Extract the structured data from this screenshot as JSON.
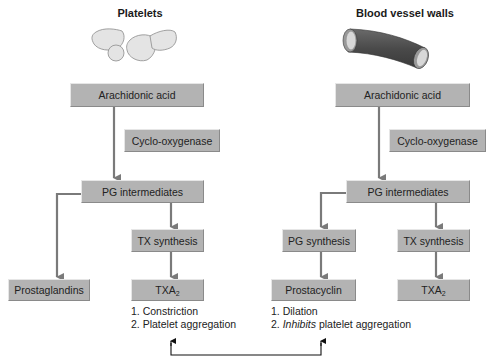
{
  "left": {
    "title": "Platelets",
    "illustration": "platelets-illustration",
    "nodes": {
      "arachidonic_acid": "Arachidonic acid",
      "enzyme": "Cyclo-oxygenase",
      "pg_intermediates": "PG intermediates",
      "tx_synthesis": "TX synthesis",
      "prostaglandins": "Prostaglandins",
      "txa_base": "TXA",
      "txa_sub": "2"
    },
    "effects": [
      "1. Constriction",
      "2. Platelet aggregation"
    ]
  },
  "right": {
    "title": "Blood vessel walls",
    "illustration": "blood-vessel-illustration",
    "nodes": {
      "arachidonic_acid": "Arachidonic acid",
      "enzyme": "Cyclo-oxygenase",
      "pg_intermediates": "PG intermediates",
      "pg_synthesis": "PG synthesis",
      "tx_synthesis": "TX synthesis",
      "prostacyclin": "Prostacyclin",
      "txa_base": "TXA",
      "txa_sub": "2"
    },
    "effects": {
      "line1": "1. Dilation",
      "line2_prefix": "2. ",
      "line2_italic": "Inhibits",
      "line2_suffix": " platelet aggregation"
    }
  },
  "colors": {
    "box_fill": "#b3b3b3",
    "arrow": "#7a7a7a",
    "bracket": "#111111",
    "vessel": "#555555"
  }
}
